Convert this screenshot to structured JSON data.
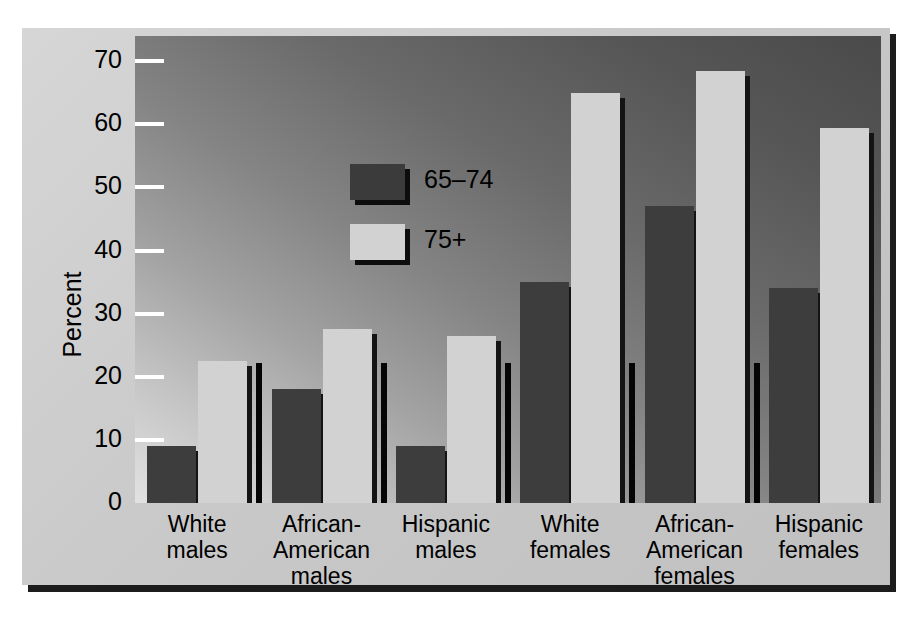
{
  "chart_data": {
    "type": "bar",
    "title": "",
    "subtitle": "",
    "xlabel": "",
    "ylabel": "Percent",
    "ylim": [
      0,
      74
    ],
    "yticks": [
      0,
      10,
      20,
      30,
      40,
      50,
      60,
      70
    ],
    "ytick_labels": [
      "0",
      "10",
      "20",
      "30",
      "40",
      "50",
      "60",
      "70"
    ],
    "grid": false,
    "legend_position": "upper-left-inside",
    "categories": [
      "White\nmales",
      "African-\nAmerican\nmales",
      "Hispanic\nmales",
      "White\nfemales",
      "African-\nAmerican\nfemales",
      "Hispanic\nfemales"
    ],
    "category_lines": [
      [
        "White",
        "males"
      ],
      [
        "African-",
        "American",
        "males"
      ],
      [
        "Hispanic",
        "males"
      ],
      [
        "White",
        "females"
      ],
      [
        "African-",
        "American",
        "females"
      ],
      [
        "Hispanic",
        "females"
      ]
    ],
    "series": [
      {
        "name": "65–74",
        "color": "#3d3d3d",
        "values": [
          9,
          18,
          9,
          35,
          47,
          34
        ]
      },
      {
        "name": "75+",
        "color": "#d2d2d2",
        "values": [
          22.5,
          27.5,
          26.5,
          65,
          68.5,
          59.5
        ]
      }
    ]
  },
  "legend": {
    "items": [
      {
        "label": "65–74",
        "swatch": "dark"
      },
      {
        "label": "75+",
        "swatch": "light"
      }
    ]
  },
  "axis": {
    "y_title": "Percent"
  },
  "colors": {
    "series_65_74": "#3d3d3d",
    "series_75_plus": "#d2d2d2",
    "panel_background": "#c9c9c9",
    "plot_gradient_dark": "#4a4a4a",
    "plot_gradient_light": "#e2e2e2",
    "tick_mark": "#ffffff",
    "separator": "#050505",
    "text": "#000000"
  }
}
